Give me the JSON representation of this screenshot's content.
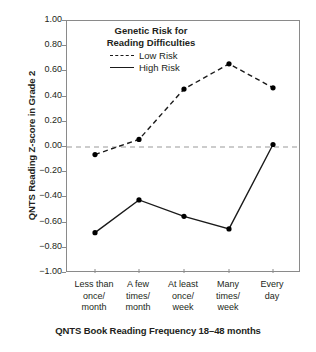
{
  "chart_data": {
    "type": "line",
    "title": "",
    "xlabel": "QNTS Book Reading Frequency 18–48 months",
    "ylabel": "QNTS Reading Z-score in Grade 2",
    "categories": [
      "Less than once/ month",
      "A few times/ month",
      "At least once/ week",
      "Many times/ week",
      "Every day"
    ],
    "category_lines": [
      [
        "Less than",
        "once/",
        "month"
      ],
      [
        "A few",
        "times/",
        "month"
      ],
      [
        "At least",
        "once/",
        "week"
      ],
      [
        "Many",
        "times/",
        "week"
      ],
      [
        "Every",
        "day"
      ]
    ],
    "series": [
      {
        "name": "Low Risk",
        "style": "dashed",
        "values": [
          -0.06,
          0.06,
          0.46,
          0.66,
          0.47
        ]
      },
      {
        "name": "High Risk",
        "style": "solid",
        "values": [
          -0.68,
          -0.42,
          -0.55,
          -0.65,
          0.02
        ]
      }
    ],
    "ylim": [
      -1.0,
      1.0
    ],
    "yticks": [
      "1.00",
      "0.80",
      "0.60",
      "0.40",
      "0.20",
      "0.00",
      "−0.20",
      "−0.40",
      "−0.60",
      "−0.80",
      "−1.00"
    ],
    "ytick_values": [
      1.0,
      0.8,
      0.6,
      0.4,
      0.2,
      0.0,
      -0.2,
      -0.4,
      -0.6,
      -0.8,
      -1.0
    ],
    "grid": false,
    "reference_line": {
      "value": 0.0,
      "style": "dashed",
      "color": "#999999"
    },
    "legend": {
      "position": "top-left-inside",
      "title_lines": [
        "Genetic Risk for",
        "Reading Difficulties"
      ],
      "entries": [
        {
          "label": "Low Risk",
          "style": "dashed"
        },
        {
          "label": "High Risk",
          "style": "solid"
        }
      ]
    },
    "colors": {
      "series_line": "#1a1a1a",
      "marker": "#000000",
      "axis": "#8a8a8a",
      "reference": "#999999",
      "text": "#231f20",
      "background": "#ffffff"
    }
  }
}
